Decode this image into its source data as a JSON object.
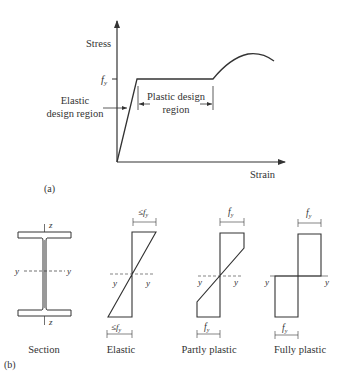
{
  "figure": {
    "part_a": {
      "label": "(a)",
      "y_axis_label": "Stress",
      "x_axis_label": "Strain",
      "yield_tick_label": "f",
      "yield_tick_sub": "y",
      "elastic_region_line1": "Elastic",
      "elastic_region_line2": "design region",
      "plastic_region_line1": "Plastic design",
      "plastic_region_line2": "region"
    },
    "part_b": {
      "label": "(b)",
      "section": {
        "caption": "Section",
        "axis_z_top": "z",
        "axis_z_bottom": "z",
        "axis_y_left": "y",
        "axis_y_right": "y"
      },
      "elastic": {
        "caption": "Elastic",
        "top_label": "≤f",
        "bottom_label": "≤f",
        "sub": "y",
        "axis_left": "y",
        "axis_right": "y"
      },
      "partly_plastic": {
        "caption": "Partly plastic",
        "top_label": "f",
        "bottom_label": "f",
        "sub": "y",
        "axis_left": "y",
        "axis_right": "y"
      },
      "fully_plastic": {
        "caption": "Fully plastic",
        "top_label": "f",
        "bottom_label": "f",
        "sub": "y",
        "axis_left": "y",
        "axis_right": "y"
      }
    }
  },
  "colors": {
    "line": "#333333",
    "background": "#ffffff"
  }
}
